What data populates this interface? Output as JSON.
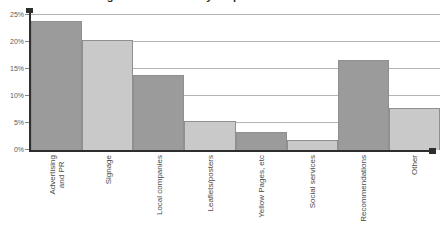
{
  "chart_data": {
    "type": "bar",
    "title": "Marketing channels used by respondents",
    "xlabel": "",
    "ylabel": "",
    "ylim": [
      0,
      25
    ],
    "ytick_labels": [
      "25%",
      "20%",
      "15%",
      "10%",
      "5%",
      "0%"
    ],
    "ytick_values": [
      25,
      20,
      15,
      10,
      5,
      0
    ],
    "grid": true,
    "legend": "none",
    "categories": [
      "Advertising and PR",
      "Signage",
      "Local companies",
      "Leaflets/posters",
      "Yellow Pages, etc",
      "Social services",
      "Recommendations",
      "Other"
    ],
    "category_lines": [
      [
        "Advertising",
        "and PR"
      ],
      [
        "Signage"
      ],
      [
        "Local companies"
      ],
      [
        "Leaflets/posters"
      ],
      [
        "Yellow Pages, etc"
      ],
      [
        "Social services"
      ],
      [
        "Recommendations"
      ],
      [
        "Other"
      ]
    ],
    "values": [
      23.7,
      20.3,
      13.8,
      5.3,
      3.3,
      1.8,
      16.6,
      7.8
    ],
    "bar_colors": [
      "#9b9b9b",
      "#c9c9c9",
      "#9b9b9b",
      "#c9c9c9",
      "#9b9b9b",
      "#c9c9c9",
      "#9b9b9b",
      "#c9c9c9"
    ],
    "bar_border_color": "#8f8f8f",
    "axis_color": "#2e2e2e",
    "grid_color": "#b4b4b4"
  }
}
